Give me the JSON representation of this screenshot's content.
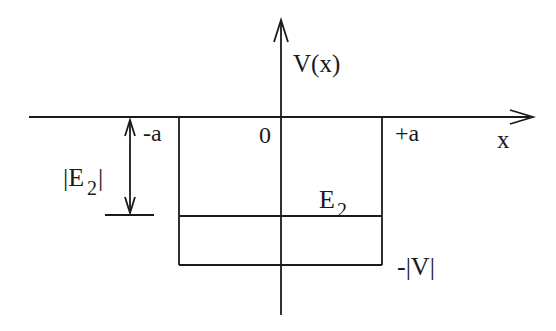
{
  "diagram": {
    "type": "finite square potential well",
    "axes": {
      "y_label": "V(x)",
      "x_label": "x",
      "origin_label": "0"
    },
    "well": {
      "left_label": "-a",
      "right_label": "+a",
      "depth_label": "-|V|"
    },
    "energy_level": {
      "label_main": "E",
      "label_sub": "2"
    },
    "binding_energy": {
      "label_open": "|E",
      "label_sub": "2",
      "label_close": "|"
    },
    "colors": {
      "stroke": "#1a1a1a",
      "background": "#ffffff"
    }
  }
}
